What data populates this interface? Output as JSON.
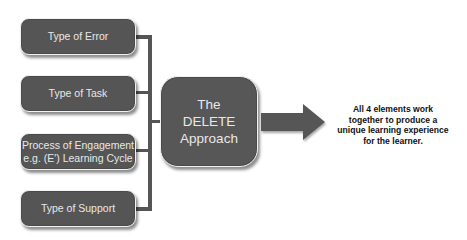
{
  "diagram": {
    "left_boxes": [
      {
        "lines": [
          "Type of Error"
        ]
      },
      {
        "lines": [
          "Type of Task"
        ]
      },
      {
        "lines": [
          "Process of Engagement",
          "e.g. (E') Learning Cycle"
        ]
      },
      {
        "lines": [
          "Type of Support"
        ]
      }
    ],
    "center_box": {
      "lines": [
        "The",
        "DELETE",
        "Approach"
      ]
    },
    "caption": {
      "lines": [
        "All 4 elements work",
        "together to produce a",
        "unique learning experience",
        "for the learner."
      ]
    },
    "colors": {
      "box_fill": "#555555",
      "box_border": "#f2f2f2",
      "box_text": "#e8e8e8",
      "connector": "#555555",
      "caption_text": "#111111",
      "background": "#ffffff"
    }
  }
}
